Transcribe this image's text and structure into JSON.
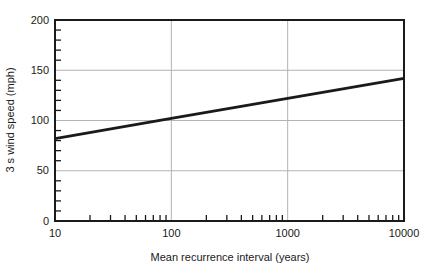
{
  "figure": {
    "x_axis_title": "Mean recurrence interval (years)",
    "y_axis_title": "3 s wind speed (mph)"
  },
  "chart_data": {
    "type": "line",
    "title": "",
    "xlabel": "Mean recurrence interval (years)",
    "ylabel": "3 s wind speed (mph)",
    "xscale": "log",
    "yscale": "linear",
    "xlim": [
      10,
      10000
    ],
    "ylim": [
      0,
      200
    ],
    "x": [
      10,
      100,
      1000,
      10000
    ],
    "series": [
      {
        "name": "3 s wind speed",
        "values": [
          82,
          102,
          122,
          142
        ]
      }
    ],
    "x_ticks": [
      10,
      100,
      1000,
      10000
    ],
    "x_tick_labels": [
      "10",
      "100",
      "1000",
      "10000"
    ],
    "y_ticks": [
      0,
      50,
      100,
      150,
      200
    ],
    "y_tick_labels": [
      "0",
      "50",
      "100",
      "150",
      "200"
    ],
    "y_minor_tick_step": 10,
    "x_minor_ticks": "2-9 per log decade",
    "grid": true,
    "legend_position": "none",
    "colors": {
      "line": "#1a1a1a",
      "grid": "#b3b3b3",
      "frame": "#1a1a1a",
      "text": "#1a1a1a",
      "background": "#ffffff"
    }
  }
}
